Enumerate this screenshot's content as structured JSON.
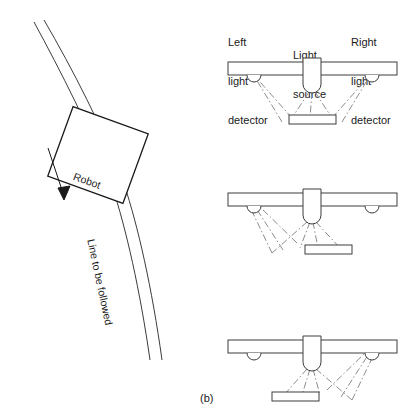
{
  "figure": {
    "caption": "(b)",
    "robot_panel": {
      "robot_label": "Robot",
      "line_label": "Line to be followed",
      "direction_arrow_name": "travel-direction-arrow"
    },
    "sensor_panels": {
      "labels": {
        "left_detector": "Left\nlight\ndetector",
        "left_detector_lines": [
          "Left",
          "light",
          "detector"
        ],
        "light_source": "Light\nsource",
        "light_source_lines": [
          "Light",
          "source"
        ],
        "right_detector": "Right\nlight\ndetector",
        "right_detector_lines": [
          "Right",
          "light",
          "detector"
        ]
      },
      "panels": [
        {
          "name": "panel-centered",
          "line_position": "centered",
          "description": "Line strip centered beneath the light source; reflected rays reach both detectors"
        },
        {
          "name": "panel-line-right",
          "line_position": "right-of-center",
          "description": "Line strip offset right; reflected rays reach the left detector"
        },
        {
          "name": "panel-line-left",
          "line_position": "left-of-center",
          "description": "Line strip offset left; reflected rays reach the right detector"
        }
      ]
    }
  },
  "colors": {
    "ink": "#1a1a1a",
    "outline": "#3c3c3c",
    "ray": "#8c8c8c",
    "background": "#ffffff"
  }
}
